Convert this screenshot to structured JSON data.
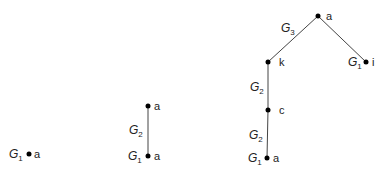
{
  "diagram": {
    "trees": [
      {
        "id": "tree-1",
        "nodes": [
          {
            "id": "a",
            "label": "a",
            "x": 29,
            "y": 154,
            "gen": "G",
            "gen_sub": "1"
          }
        ],
        "edges": []
      },
      {
        "id": "tree-2",
        "nodes": [
          {
            "id": "a_top",
            "label": "a",
            "x": 148,
            "y": 106
          },
          {
            "id": "a_bottom",
            "label": "a",
            "x": 148,
            "y": 156,
            "gen": "G",
            "gen_sub": "1"
          }
        ],
        "edges": [
          {
            "from": "a_bottom",
            "to": "a_top",
            "gen": "G",
            "gen_sub": "2"
          }
        ]
      },
      {
        "id": "tree-3",
        "nodes": [
          {
            "id": "a_root",
            "label": "a",
            "x": 318,
            "y": 16
          },
          {
            "id": "k",
            "label": "k",
            "x": 268,
            "y": 62
          },
          {
            "id": "i",
            "label": "i",
            "x": 366,
            "y": 62,
            "gen": "G",
            "gen_sub": "1"
          },
          {
            "id": "c",
            "label": "c",
            "x": 268,
            "y": 110
          },
          {
            "id": "a_leaf",
            "label": "a",
            "x": 267,
            "y": 158,
            "gen": "G",
            "gen_sub": "1"
          }
        ],
        "edges": [
          {
            "from": "k",
            "to": "a_root",
            "gen": "G",
            "gen_sub": "3"
          },
          {
            "from": "i",
            "to": "a_root"
          },
          {
            "from": "c",
            "to": "k",
            "gen": "G",
            "gen_sub": "2"
          },
          {
            "from": "a_leaf",
            "to": "c",
            "gen": "G",
            "gen_sub": "2"
          }
        ]
      }
    ]
  }
}
